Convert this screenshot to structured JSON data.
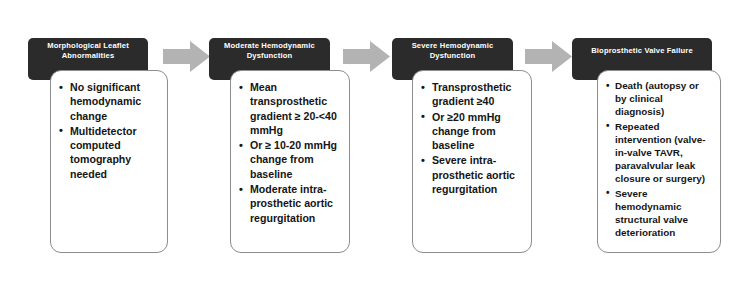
{
  "diagram": {
    "background_color": "#ffffff",
    "header_color": "#2b2b2b",
    "header_text_color": "#ffffff",
    "arrow_color": "#b3b3b3",
    "body_border_color": "#8d8d8d",
    "arrow_icon_name": "right-block-arrow-icon",
    "stages": [
      {
        "id": "morphological-leaflet-abnormalities",
        "header": "Morphological Leaflet Abnormalities",
        "bullets": [
          "No significant hemodynamic change",
          "Multidetector computed tomography needed"
        ]
      },
      {
        "id": "moderate-hemodynamic-dysfunction",
        "header": "Moderate Hemodynamic Dysfunction",
        "bullets": [
          "Mean transprosthetic gradient ≥ 20-<40 mmHg",
          "Or ≥ 10-20 mmHg change from baseline",
          "Moderate intra-prosthetic aortic regurgitation"
        ]
      },
      {
        "id": "severe-hemodynamic-dysfunction",
        "header": "Severe Hemodynamic Dysfunction",
        "bullets": [
          "Transprosthetic gradient ≥40",
          "Or ≥20 mmHg change from baseline",
          "Severe intra-prosthetic aortic regurgitation"
        ]
      },
      {
        "id": "bioprosthetic-valve-failure",
        "header": "Bioprosthetic Valve Failure",
        "bullets": [
          "Death (autopsy or by clinical diagnosis)",
          "Repeated intervention (valve-in-valve TAVR, paravalvular leak closure or surgery)",
          "Severe hemodynamic structural valve deterioration"
        ]
      }
    ]
  }
}
